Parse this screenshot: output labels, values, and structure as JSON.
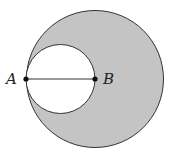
{
  "diagram": {
    "labels": {
      "a": "A",
      "b": "B"
    },
    "colors": {
      "shaded": "#c4c4c4",
      "stroke": "#333333",
      "inner": "#ffffff"
    },
    "outer_circle": {
      "cx": 95,
      "cy": 79,
      "r": 69
    },
    "inner_circle": {
      "cx": 60.5,
      "cy": 79,
      "r": 34.5
    },
    "segment": {
      "from": "A",
      "to": "B"
    }
  }
}
